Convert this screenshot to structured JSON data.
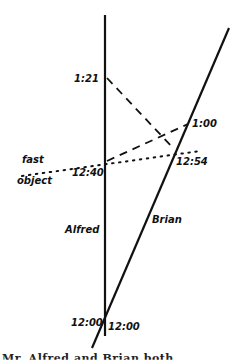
{
  "diagram": {
    "worldlines": {
      "alfred": {
        "label": "Alfred",
        "start_label": "12:00"
      },
      "brian": {
        "label": "Brian",
        "start_label": "12:00"
      }
    },
    "events": {
      "alfred_signal_receive": "1:21",
      "brian_signal_send": "1:00",
      "alfred_fast_object": "12:40",
      "brian_fast_object": "12:54"
    },
    "fast_object": {
      "label_line1": "fast",
      "label_line2": "object"
    },
    "colors": {
      "ink": "#111111",
      "background": "#ffffff"
    }
  },
  "caption": {
    "text": "Mr. Alfred and Brian both..."
  }
}
